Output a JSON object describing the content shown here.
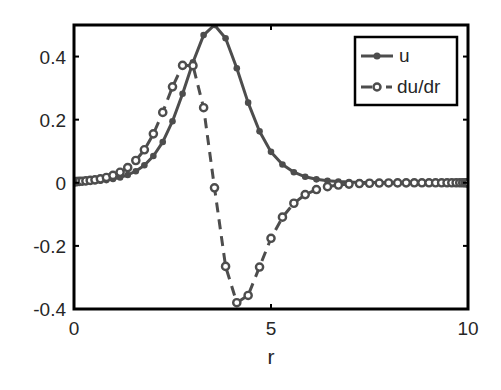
{
  "chart_data": {
    "type": "line",
    "title": "",
    "xlabel": "r",
    "ylabel": "",
    "xlim": [
      0,
      10
    ],
    "ylim": [
      -0.4,
      0.5
    ],
    "xticks": [
      0,
      5,
      10
    ],
    "xtick_labels": [
      "0",
      "5",
      "10"
    ],
    "yticks": [
      -0.4,
      -0.2,
      0,
      0.2,
      0.4
    ],
    "ytick_labels": [
      "-0.4",
      "-0.2",
      "0",
      "0.2",
      "0.4"
    ],
    "grid": false,
    "legend_position": "upper right",
    "x": [
      0,
      0.0085,
      0.0338,
      0.076,
      0.1348,
      0.2101,
      0.3015,
      0.4112,
      0.5319,
      0.6699,
      0.8226,
      0.9894,
      1.1698,
      1.3632,
      1.5688,
      1.786,
      2.0142,
      2.2525,
      2.5,
      2.756,
      3.0196,
      3.2899,
      3.566,
      3.847,
      4.1318,
      4.4196,
      4.7093,
      5.0,
      5.2907,
      5.5804,
      5.8682,
      6.153,
      6.434,
      6.71,
      6.9804,
      7.244,
      7.5,
      7.7475,
      7.9858,
      8.214,
      8.4312,
      8.6368,
      8.8302,
      9.0106,
      9.1774,
      9.3301,
      9.4682,
      9.5888,
      9.6985,
      9.7899,
      9.8652,
      9.9239,
      9.9662,
      9.9915,
      10.0
    ],
    "series": [
      {
        "name": "u",
        "style": "solid line, filled dot markers",
        "color": "#4d4d4d",
        "values": [
          0.0016,
          0.0017,
          0.0018,
          0.0019,
          0.0022,
          0.0025,
          0.003,
          0.0037,
          0.0048,
          0.0063,
          0.0085,
          0.0118,
          0.0169,
          0.0246,
          0.0367,
          0.0555,
          0.085,
          0.129,
          0.195,
          0.282,
          0.382,
          0.468,
          0.5,
          0.458,
          0.363,
          0.254,
          0.163,
          0.098,
          0.058,
          0.0336,
          0.019,
          0.0109,
          0.0062,
          0.0036,
          0.0021,
          0.0012,
          0.0007,
          0.0005,
          0.0003,
          0.0002,
          0.0001,
          0.0001,
          0.0001,
          0,
          0,
          0,
          0,
          0,
          0,
          0,
          0,
          0,
          0,
          0,
          0
        ]
      },
      {
        "name": "du/dr",
        "style": "dashed line, open circle markers",
        "color": "#4d4d4d",
        "values": [
          0.0033,
          0.0034,
          0.0035,
          0.0038,
          0.0043,
          0.005,
          0.006,
          0.0075,
          0.0095,
          0.0125,
          0.0169,
          0.0234,
          0.0333,
          0.0481,
          0.0706,
          0.1046,
          0.155,
          0.223,
          0.304,
          0.372,
          0.371,
          0.238,
          -0.016,
          -0.265,
          -0.38,
          -0.357,
          -0.267,
          -0.176,
          -0.109,
          -0.0649,
          -0.0374,
          -0.0215,
          -0.0124,
          -0.0071,
          -0.0042,
          -0.0025,
          -0.0015,
          -0.0009,
          -0.0006,
          -0.0004,
          -0.0002,
          -0.0001,
          -0.0001,
          0,
          0,
          0,
          0,
          0,
          0,
          0,
          0,
          0,
          0,
          0,
          0
        ]
      }
    ]
  },
  "legend": {
    "items": [
      {
        "label": "u"
      },
      {
        "label": "du/dr"
      }
    ]
  },
  "colors": {
    "axis": "#000000",
    "series": "#4d4d4d",
    "text": "#262626",
    "background": "#ffffff"
  }
}
